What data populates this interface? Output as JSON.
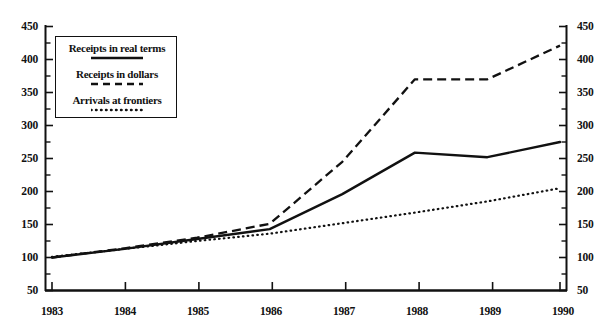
{
  "chart_data": {
    "type": "line",
    "title": "",
    "subtitle": "",
    "xlabel": "",
    "ylabel": "",
    "x": [
      1983,
      1984,
      1985,
      1986,
      1987,
      1988,
      1989,
      1990
    ],
    "categories": [
      "1983",
      "1984",
      "1985",
      "1986",
      "1987",
      "1988",
      "1989",
      "1990"
    ],
    "xlim": [
      1983,
      1990
    ],
    "ylim": [
      50,
      450
    ],
    "y_ticks_major": [
      50,
      100,
      150,
      200,
      250,
      300,
      350,
      400,
      450
    ],
    "y_ticks_minor": [
      75,
      125,
      175,
      225,
      275,
      325,
      375,
      425
    ],
    "y_axis_left_labels": [
      "50",
      "100",
      "150",
      "200",
      "250",
      "300",
      "350",
      "400",
      "450"
    ],
    "y_axis_right_labels": [
      "50",
      "100",
      "150",
      "200",
      "250",
      "300",
      "350",
      "400",
      "450"
    ],
    "grid": false,
    "legend_position": "upper-left-inset",
    "series": [
      {
        "name": "Receipts in real terms",
        "style": "solid",
        "color": "#111111",
        "values": [
          100,
          113,
          128,
          143,
          196,
          259,
          252,
          275
        ]
      },
      {
        "name": "Receipts in dollars",
        "style": "dashed",
        "color": "#111111",
        "values": [
          100,
          114,
          130,
          151,
          245,
          370,
          370,
          421
        ]
      },
      {
        "name": "Arrivals at frontiers",
        "style": "dotted",
        "color": "#111111",
        "values": [
          101,
          113,
          125,
          136,
          152,
          168,
          185,
          205
        ]
      }
    ]
  },
  "legend": {
    "items": [
      {
        "label": "Receipts in real terms",
        "style": "solid"
      },
      {
        "label": "Receipts in dollars",
        "style": "dashed"
      },
      {
        "label": "Arrivals at frontiers",
        "style": "dotted"
      }
    ]
  },
  "axes": {
    "left_labels": [
      "450",
      "400",
      "350",
      "300",
      "250",
      "200",
      "150",
      "100",
      "50"
    ],
    "right_labels": [
      "450",
      "400",
      "350",
      "300",
      "250",
      "200",
      "150",
      "100",
      "50"
    ],
    "x_labels": [
      "1983",
      "1984",
      "1985",
      "1986",
      "1987",
      "1988",
      "1989",
      "1990"
    ]
  },
  "colors": {
    "ink": "#111111",
    "background": "#ffffff"
  }
}
